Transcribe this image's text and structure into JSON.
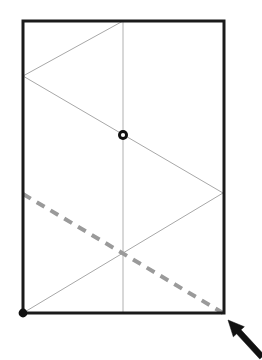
{
  "figure": {
    "canvas": {
      "width": 262,
      "height": 360,
      "background": "#ffffff"
    },
    "colors": {
      "frame": "#1a1a1a",
      "fold_line": "#a8a8a8",
      "center_line": "#b0b0b0",
      "dashed_line": "#9a9a9a",
      "marker_fill": "#111111",
      "marker_ring_inner": "#ffffff",
      "arrow": "#111111"
    },
    "rectangle": {
      "label": "outer-frame",
      "x": 23,
      "y": 21,
      "width": 201,
      "height": 292,
      "stroke_width": 3
    },
    "center_line": {
      "label": "vertical-center-line",
      "x1": 123,
      "y1": 21,
      "x2": 123,
      "y2": 313,
      "stroke_width": 1
    },
    "zigzag": {
      "label": "fold-zigzag-polyline",
      "stroke_width": 1,
      "points": [
        {
          "x": 123,
          "y": 21
        },
        {
          "x": 23,
          "y": 76
        },
        {
          "x": 223,
          "y": 193
        },
        {
          "x": 23,
          "y": 313
        }
      ]
    },
    "dashed_line": {
      "label": "dashed-diagonal",
      "x1": 23,
      "y1": 194,
      "x2": 223,
      "y2": 313,
      "stroke_width": 4,
      "dash_pattern": "9 7"
    },
    "markers": [
      {
        "label": "open-ring-marker",
        "type": "ring",
        "x": 123,
        "y": 135,
        "outer_radius": 5.0,
        "inner_radius": 2.1
      },
      {
        "label": "filled-dot-marker",
        "type": "dot",
        "x": 23,
        "y": 313,
        "radius": 4.4
      }
    ],
    "arrow": {
      "label": "pointer-arrow",
      "tip": {
        "x": 228,
        "y": 320
      },
      "tail": {
        "x": 262,
        "y": 357
      },
      "shaft_width": 6,
      "head_length": 16,
      "head_width": 15
    }
  }
}
